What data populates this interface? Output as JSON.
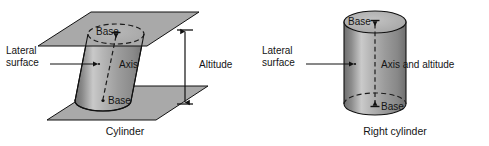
{
  "figure": {
    "title": "",
    "background_color": "#ffffff",
    "panels": [
      {
        "id": "oblique-cylinder",
        "caption": "Cylinder",
        "solid_type": "oblique cylinder between two parallel planes",
        "labels": {
          "top_base": "Base",
          "bottom_base": "Base",
          "axis": "Axis",
          "lateral_surface_line1": "Lateral",
          "lateral_surface_line2": "surface",
          "altitude": "Altitude"
        },
        "features": {
          "planes": 2,
          "plane_fill": "#a9a9a9",
          "body_shading": "vertical cylindrical gradient, dark edges, light left-of-center highlight",
          "top_base_outline": "dashed ellipse",
          "bottom_base_outline": "solid ellipse front, dashed ellipse back",
          "axis_style": "dashed with arrow caps at both bases",
          "altitude_style": "double-headed vertical arrow with end ticks"
        }
      },
      {
        "id": "right-cylinder",
        "caption": "Right cylinder",
        "solid_type": "right circular cylinder",
        "labels": {
          "top_base": "Base",
          "bottom_base": "Base",
          "axis": "Axis and altitude",
          "lateral_surface_line1": "Lateral",
          "lateral_surface_line2": "surface"
        },
        "features": {
          "planes": 0,
          "body_shading": "vertical cylindrical gradient, dark edges, light left-of-center highlight",
          "top_base_outline": "solid ellipse",
          "bottom_base_outline": "solid front arc, dashed back arc",
          "axis_style": "dashed vertical with arrow caps at both bases"
        }
      }
    ],
    "colors": {
      "stroke": "#111111",
      "plane_gray": "#a9a9a9",
      "body_dark": "#6f6f6f",
      "body_mid": "#9a9a9a",
      "body_light": "#cfcfcf",
      "top_face_gray": "#b4b4b4"
    }
  }
}
